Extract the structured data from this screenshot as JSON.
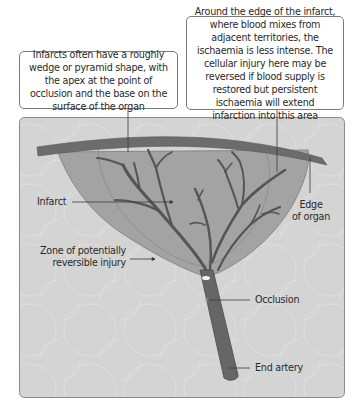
{
  "diagram": {
    "callouts": {
      "wedge_shape": "Infarcts often have a roughly wedge or pyramid shape, with the apex at the point of occlusion and the base on the surface of the organ",
      "edge_zone": "Around the edge of the infarct, where blood mixes from adjacent territories, the ischaemia is less intense. The cellular injury here may be reversed if blood supply is restored but persistent ischaemia will extend infarction into this area"
    },
    "labels": {
      "infarct": "Infarct",
      "zone_line1": "Zone of potentially",
      "zone_line2": "reversible injury",
      "edge_line1": "Edge",
      "edge_line2": "of organ",
      "occlusion": "Occlusion",
      "end_artery": "End artery"
    },
    "colors": {
      "background_panel": "#d4d4d4",
      "organ_surface": "#6e6e6e",
      "infarct_fill": "#9c9c9c",
      "artery": "#5a5a5a",
      "leader_line": "#3a3a3a"
    }
  }
}
